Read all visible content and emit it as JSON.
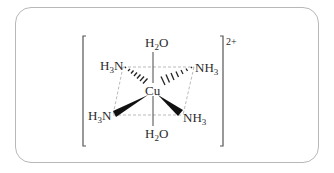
{
  "diagram": {
    "title": "",
    "center_atom": "Cu",
    "charge": "2+",
    "ligands": {
      "axial_top": {
        "main": "H",
        "sub": "2",
        "tail": "O"
      },
      "axial_bottom": {
        "main": "H",
        "sub": "2",
        "tail": "O"
      },
      "eq_upper_left": {
        "main": "H",
        "sub": "3",
        "tail": "N"
      },
      "eq_upper_right": {
        "main": "NH",
        "sub": "3",
        "tail": ""
      },
      "eq_lower_left": {
        "main": "H",
        "sub": "3",
        "tail": "N"
      },
      "eq_lower_right": {
        "main": "NH",
        "sub": "3",
        "tail": ""
      }
    },
    "bonds": {
      "axial": "line",
      "upper_ligands": "hashed-wedge",
      "lower_ligands": "solid-wedge",
      "equatorial_plane": "dashed"
    },
    "colors": {
      "ink": "#2a2a2a",
      "dashed": "#a8a8a8",
      "bracket": "#555555",
      "frame": "#b8b8b8"
    }
  }
}
